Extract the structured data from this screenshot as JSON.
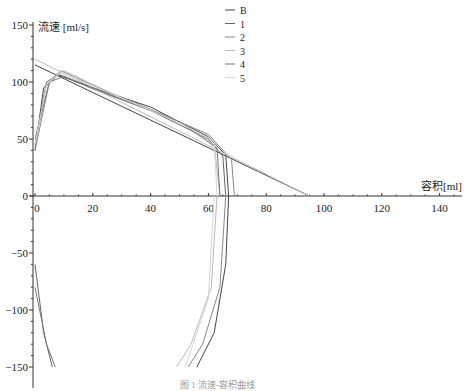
{
  "chart_data": {
    "type": "line",
    "title": "",
    "xlabel": "容积[ml]",
    "ylabel": "流速 [ml/s]",
    "xlim": [
      0,
      145
    ],
    "ylim": [
      -150,
      150
    ],
    "x_ticks": [
      "0",
      "20",
      "40",
      "60",
      "80",
      "100",
      "120",
      "140"
    ],
    "y_ticks": [
      "150",
      "100",
      "50",
      "0",
      "−50",
      "−100",
      "−150"
    ],
    "grid": false,
    "legend_position": "top-right",
    "legend": [
      "B",
      "1",
      "2",
      "3",
      "4",
      "5"
    ],
    "series": [
      {
        "name": "B",
        "color": "#444444",
        "expiratory": [
          [
            0,
            40
          ],
          [
            3,
            95
          ],
          [
            8,
            106
          ],
          [
            20,
            95
          ],
          [
            40,
            78
          ],
          [
            60,
            52
          ],
          [
            66,
            36
          ],
          [
            67,
            0
          ]
        ],
        "inspiratory": [
          [
            67,
            0
          ],
          [
            66,
            -60
          ],
          [
            62,
            -120
          ],
          [
            56,
            -150
          ]
        ],
        "reference_line": [
          [
            0,
            115
          ],
          [
            95,
            0
          ]
        ]
      },
      {
        "name": "1",
        "color": "#666666",
        "expiratory": [
          [
            0,
            45
          ],
          [
            4,
            100
          ],
          [
            8,
            107
          ],
          [
            20,
            94
          ],
          [
            40,
            75
          ],
          [
            60,
            50
          ],
          [
            65,
            35
          ],
          [
            66,
            0
          ]
        ],
        "inspiratory": [
          [
            0,
            -60
          ],
          [
            3,
            -120
          ],
          [
            6,
            -150
          ]
        ]
      },
      {
        "name": "2",
        "color": "#888888",
        "expiratory": [
          [
            0,
            40
          ],
          [
            5,
            100
          ],
          [
            9,
            110
          ],
          [
            20,
            97
          ],
          [
            40,
            76
          ],
          [
            60,
            54
          ],
          [
            68,
            32
          ],
          [
            69,
            0
          ]
        ],
        "inspiratory": [
          [
            66,
            0
          ],
          [
            64,
            -80
          ],
          [
            58,
            -130
          ],
          [
            53,
            -150
          ]
        ]
      },
      {
        "name": "3",
        "color": "#bbbbbb",
        "expiratory": [
          [
            0,
            45
          ],
          [
            5,
            102
          ],
          [
            10,
            110
          ],
          [
            30,
            86
          ],
          [
            50,
            65
          ],
          [
            62,
            45
          ],
          [
            64,
            0
          ]
        ],
        "inspiratory": [
          [
            63,
            0
          ],
          [
            61,
            -80
          ],
          [
            54,
            -130
          ],
          [
            49,
            -150
          ]
        ],
        "reference_line": [
          [
            0,
            120
          ],
          [
            95,
            0
          ]
        ]
      },
      {
        "name": "4",
        "color": "#777777",
        "expiratory": [
          [
            0,
            50
          ],
          [
            5,
            100
          ],
          [
            10,
            105
          ],
          [
            30,
            85
          ],
          [
            50,
            65
          ],
          [
            63,
            42
          ],
          [
            64,
            0
          ]
        ],
        "inspiratory": [
          [
            0,
            -80
          ],
          [
            4,
            -130
          ],
          [
            7,
            -150
          ]
        ]
      },
      {
        "name": "5",
        "color": "#d5d5d5",
        "expiratory": [
          [
            0,
            45
          ],
          [
            4,
            98
          ],
          [
            9,
            108
          ],
          [
            30,
            86
          ],
          [
            50,
            64
          ],
          [
            62,
            48
          ],
          [
            63,
            0
          ]
        ],
        "inspiratory": [
          [
            62,
            0
          ],
          [
            60,
            -90
          ],
          [
            52,
            -150
          ]
        ]
      }
    ]
  },
  "caption": "图 1  流速-容积曲线"
}
